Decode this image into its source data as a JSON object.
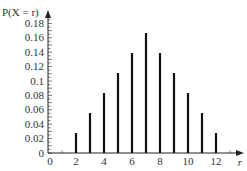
{
  "chart_data": {
    "type": "bar",
    "title": "",
    "xlabel": "r",
    "ylabel": "P(X = r)",
    "categories": [
      2,
      3,
      4,
      5,
      6,
      7,
      8,
      9,
      10,
      11,
      12
    ],
    "values": [
      0.0278,
      0.0556,
      0.0833,
      0.1111,
      0.1389,
      0.1667,
      0.1389,
      0.1111,
      0.0833,
      0.0556,
      0.0278
    ],
    "xticks": [
      "0",
      "2",
      "4",
      "6",
      "8",
      "10",
      "12"
    ],
    "yticks": [
      "0",
      "0.02",
      "0.04",
      "0.06",
      "0.08",
      "0.1",
      "0.12",
      "0.14",
      "0.16",
      "0.18"
    ],
    "xlim": [
      0,
      13
    ],
    "ylim": [
      0,
      0.19
    ],
    "grid": false,
    "legend": null
  },
  "colors": {
    "bar": "#111111",
    "axis": "#222222",
    "text": "#333333"
  }
}
